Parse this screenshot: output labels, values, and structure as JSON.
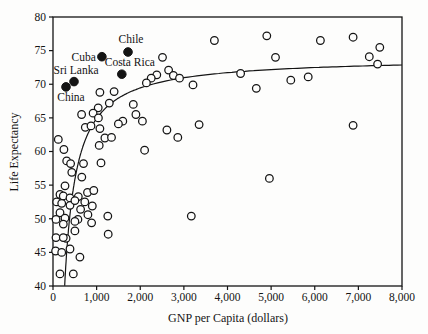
{
  "chart_data": {
    "type": "scatter",
    "title": "",
    "xlabel": "GNP per Capita (dollars)",
    "ylabel": "Life Expectancy",
    "xlim": [
      0,
      8000
    ],
    "ylim": [
      40,
      80
    ],
    "x_ticks": [
      0,
      1000,
      2000,
      3000,
      4000,
      5000,
      6000,
      7000,
      8000
    ],
    "x_tick_labels": [
      "0",
      "1,000",
      "2,000",
      "3,000",
      "4,000",
      "5,000",
      "6,000",
      "7,000",
      "8,000"
    ],
    "y_ticks": [
      40,
      45,
      50,
      55,
      60,
      65,
      70,
      75,
      80
    ],
    "y_tick_labels": [
      "40",
      "45",
      "50",
      "55",
      "60",
      "65",
      "70",
      "75",
      "80"
    ],
    "grid": false,
    "legend": "none",
    "marker_color": "#141414",
    "series": [
      {
        "name": "countries",
        "marker": "open-circle",
        "points": [
          [
            2510,
            74.0
          ],
          [
            3700,
            76.5
          ],
          [
            4900,
            77.2
          ],
          [
            5100,
            74.0
          ],
          [
            6130,
            76.5
          ],
          [
            6880,
            77.0
          ],
          [
            7490,
            75.5
          ],
          [
            7250,
            74.1
          ],
          [
            7440,
            73.0
          ],
          [
            2650,
            72.1
          ],
          [
            2380,
            71.4
          ],
          [
            2760,
            71.3
          ],
          [
            4300,
            71.6
          ],
          [
            5850,
            71.1
          ],
          [
            5450,
            70.6
          ],
          [
            2900,
            70.9
          ],
          [
            2250,
            70.9
          ],
          [
            2140,
            70.2
          ],
          [
            3210,
            69.9
          ],
          [
            4660,
            69.4
          ],
          [
            1400,
            68.9
          ],
          [
            1075,
            68.8
          ],
          [
            1290,
            67.2
          ],
          [
            1840,
            67.0
          ],
          [
            1036,
            66.5
          ],
          [
            920,
            65.7
          ],
          [
            656,
            65.5
          ],
          [
            1040,
            65.0
          ],
          [
            1900,
            65.5
          ],
          [
            1600,
            64.5
          ],
          [
            1500,
            64.1
          ],
          [
            2050,
            64.5
          ],
          [
            3350,
            64.0
          ],
          [
            6880,
            63.9
          ],
          [
            740,
            63.6
          ],
          [
            870,
            63.8
          ],
          [
            1074,
            63.4
          ],
          [
            2610,
            63.2
          ],
          [
            2860,
            62.1
          ],
          [
            1190,
            62.0
          ],
          [
            1341,
            62.1
          ],
          [
            121,
            61.8
          ],
          [
            251,
            60.3
          ],
          [
            1059,
            60.9
          ],
          [
            2100,
            60.2
          ],
          [
            313,
            58.6
          ],
          [
            404,
            58.2
          ],
          [
            700,
            58.2
          ],
          [
            1100,
            58.3
          ],
          [
            430,
            56.9
          ],
          [
            660,
            56.2
          ],
          [
            4960,
            56.0
          ],
          [
            274,
            54.9
          ],
          [
            580,
            53.3
          ],
          [
            790,
            53.9
          ],
          [
            935,
            54.2
          ],
          [
            160,
            53.6
          ],
          [
            235,
            53.4
          ],
          [
            389,
            53.1
          ],
          [
            730,
            52.5
          ],
          [
            900,
            51.9
          ],
          [
            84,
            52.5
          ],
          [
            199,
            52.3
          ],
          [
            389,
            52.0
          ],
          [
            503,
            52.7
          ],
          [
            633,
            51.4
          ],
          [
            800,
            50.6
          ],
          [
            1257,
            50.4
          ],
          [
            571,
            49.9
          ],
          [
            160,
            50.9
          ],
          [
            274,
            50.1
          ],
          [
            69,
            49.9
          ],
          [
            884,
            49.4
          ],
          [
            235,
            49.2
          ],
          [
            503,
            49.6
          ],
          [
            3170,
            50.4
          ],
          [
            503,
            48.2
          ],
          [
            1265,
            47.7
          ],
          [
            69,
            47.2
          ],
          [
            300,
            47.1
          ],
          [
            235,
            47.2
          ],
          [
            60,
            45.2
          ],
          [
            199,
            45.0
          ],
          [
            389,
            45.5
          ],
          [
            617,
            44.3
          ],
          [
            160,
            41.8
          ],
          [
            465,
            41.8
          ]
        ]
      },
      {
        "name": "highlighted-countries",
        "marker": "filled-circle",
        "points": [
          {
            "label": "China",
            "x": 298,
            "y": 69.6,
            "anchor": "middle",
            "dx": 5,
            "dy": 14
          },
          {
            "label": "Sri Lanka",
            "x": 482,
            "y": 70.4,
            "anchor": "middle",
            "dx": 2,
            "dy": -8
          },
          {
            "label": "Cuba",
            "x": 1120,
            "y": 74.1,
            "anchor": "end",
            "dx": -6,
            "dy": 4
          },
          {
            "label": "Costa Rica",
            "x": 1576,
            "y": 71.5,
            "anchor": "middle",
            "dx": 8,
            "dy": -8
          },
          {
            "label": "Chile",
            "x": 1720,
            "y": 74.8,
            "anchor": "middle",
            "dx": 3,
            "dy": -9
          }
        ]
      }
    ],
    "fit_curve": {
      "type": "reciprocal",
      "formula": "y = a - b/x",
      "a": 74.0,
      "b": 9100,
      "x_start": 268,
      "x_end": 8000
    }
  }
}
